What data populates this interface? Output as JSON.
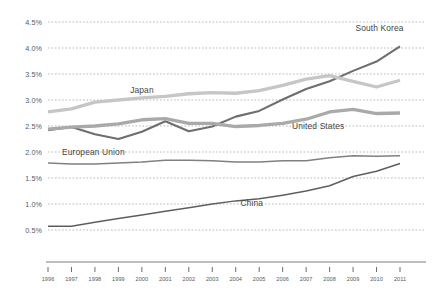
{
  "chart_data": {
    "type": "line",
    "title": "",
    "subtitle": "",
    "xlabel": "",
    "ylabel": "",
    "grid": "horizontal-dashed",
    "legend_position": "inline-labels",
    "ylim": [
      0.5,
      4.5
    ],
    "ytick_values": [
      4.5,
      4.0,
      3.5,
      3.0,
      2.5,
      2.0,
      1.5,
      1.0,
      0.5
    ],
    "ytick_labels": [
      "4.5%",
      "4.0%",
      "3.5%",
      "3.0%",
      "2.5%",
      "2.0%",
      "1.5%",
      "1.0%",
      "0.5%"
    ],
    "x": [
      1996,
      1997,
      1998,
      1999,
      2000,
      2001,
      2002,
      2003,
      2004,
      2005,
      2006,
      2007,
      2008,
      2009,
      2010,
      2011
    ],
    "xtick_labels": [
      "1996",
      "1997",
      "1998",
      "1999",
      "2000",
      "2001",
      "2002",
      "2003",
      "2004",
      "2005",
      "2006",
      "2007",
      "2008",
      "2009",
      "2010",
      "2011"
    ],
    "series": [
      {
        "name": "South Korea",
        "label": "South Korea",
        "color": "#6e6e6e",
        "width": 2.1,
        "label_x": 2009.1,
        "label_y": 4.33,
        "values": [
          2.42,
          2.48,
          2.34,
          2.25,
          2.39,
          2.59,
          2.4,
          2.49,
          2.68,
          2.79,
          3.01,
          3.21,
          3.36,
          3.56,
          3.74,
          4.03
        ]
      },
      {
        "name": "Japan",
        "label": "Japan",
        "color": "#c6c6c6",
        "width": 3.3,
        "label_x": 1999.5,
        "label_y": 3.14,
        "values": [
          2.77,
          2.83,
          2.96,
          3.0,
          3.04,
          3.07,
          3.12,
          3.14,
          3.13,
          3.18,
          3.28,
          3.4,
          3.47,
          3.36,
          3.25,
          3.38
        ]
      },
      {
        "name": "United States",
        "label": "United States",
        "color": "#a9a9a9",
        "width": 3.3,
        "label_x": 2006.4,
        "label_y": 2.44,
        "values": [
          2.44,
          2.48,
          2.5,
          2.54,
          2.62,
          2.64,
          2.55,
          2.55,
          2.49,
          2.51,
          2.55,
          2.63,
          2.77,
          2.82,
          2.74,
          2.75
        ]
      },
      {
        "name": "European Union",
        "label": "European Union",
        "color": "#808080",
        "width": 1.5,
        "label_x": 1996.6,
        "label_y": 1.94,
        "values": [
          1.79,
          1.77,
          1.77,
          1.79,
          1.81,
          1.84,
          1.84,
          1.83,
          1.81,
          1.81,
          1.83,
          1.83,
          1.89,
          1.93,
          1.92,
          1.93
        ]
      },
      {
        "name": "China",
        "label": "China",
        "color": "#5e5e5e",
        "width": 1.5,
        "label_x": 2004.2,
        "label_y": 0.97,
        "values": [
          0.57,
          0.57,
          0.65,
          0.72,
          0.79,
          0.86,
          0.93,
          1.0,
          1.06,
          1.1,
          1.17,
          1.25,
          1.35,
          1.53,
          1.63,
          1.78
        ]
      }
    ]
  }
}
